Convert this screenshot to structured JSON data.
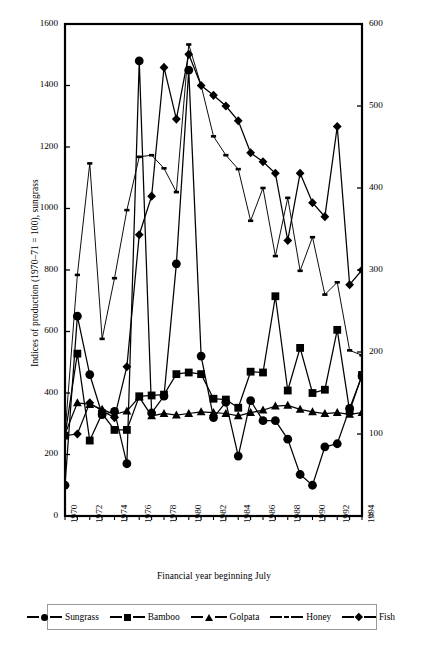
{
  "chart_data": {
    "type": "line",
    "title": "",
    "xlabel": "Financial year beginning July",
    "ylabel_left": "Indices of production (1970–71 = 100), sungrass",
    "ylabel_right": "Indices of production (1970–71 = 100), bamboo, golpata, honey and fish",
    "x": [
      1970,
      1971,
      1972,
      1973,
      1974,
      1975,
      1976,
      1977,
      1978,
      1979,
      1980,
      1981,
      1982,
      1983,
      1984,
      1985,
      1986,
      1987,
      1988,
      1989,
      1990,
      1991,
      1992,
      1993,
      1994
    ],
    "xticklabels": [
      "1970",
      "1972",
      "1974",
      "1976",
      "1978",
      "1980",
      "1982",
      "1984",
      "1986",
      "1988",
      "1990",
      "1992",
      "1994"
    ],
    "xtick_values": [
      1970,
      1972,
      1974,
      1976,
      1978,
      1980,
      1982,
      1984,
      1986,
      1988,
      1990,
      1992,
      1994
    ],
    "ylim_left": [
      0,
      1600
    ],
    "yticks_left": [
      0,
      200,
      400,
      600,
      800,
      1000,
      1200,
      1400,
      1600
    ],
    "ylim_right": [
      0,
      600
    ],
    "yticks_right": [
      0,
      100,
      200,
      300,
      400,
      500,
      600
    ],
    "grid": false,
    "legend_position": "below-plot",
    "series": [
      {
        "name": "Sungrass",
        "axis": "left",
        "marker": "circle",
        "values": [
          100,
          650,
          460,
          330,
          340,
          170,
          1480,
          335,
          390,
          820,
          1450,
          520,
          320,
          370,
          195,
          375,
          310,
          310,
          250,
          135,
          100,
          225,
          235,
          350,
          455
        ]
      },
      {
        "name": "Bamboo",
        "axis": "right",
        "marker": "square",
        "values": [
          98,
          198,
          92,
          125,
          105,
          105,
          146,
          147,
          148,
          173,
          175,
          173,
          143,
          142,
          132,
          176,
          175,
          268,
          153,
          205,
          150,
          154,
          227,
          128,
          172
        ]
      },
      {
        "name": "Golpata",
        "axis": "right",
        "marker": "triangle",
        "values": [
          100,
          138,
          136,
          130,
          124,
          128,
          145,
          122,
          125,
          123,
          125,
          127,
          126,
          125,
          122,
          126,
          129,
          134,
          135,
          130,
          127,
          125,
          126,
          124,
          126
        ]
      },
      {
        "name": "Honey",
        "axis": "right",
        "marker": "dash",
        "values": [
          100,
          294,
          430,
          216,
          290,
          373,
          438,
          440,
          424,
          395,
          575,
          525,
          463,
          440,
          423,
          360,
          400,
          317,
          388,
          299,
          340,
          270,
          285,
          202,
          196
        ]
      },
      {
        "name": "Fish",
        "axis": "right",
        "marker": "diamond",
        "values": [
          98,
          100,
          138,
          128,
          120,
          182,
          343,
          390,
          547,
          484,
          563,
          525,
          513,
          500,
          482,
          443,
          432,
          418,
          336,
          418,
          382,
          365,
          475,
          282,
          300
        ]
      }
    ]
  },
  "legend": {
    "items": [
      {
        "label": "Sungrass",
        "marker": "circle"
      },
      {
        "label": "Bamboo",
        "marker": "square"
      },
      {
        "label": "Golpata",
        "marker": "triangle"
      },
      {
        "label": "Honey",
        "marker": "dash"
      },
      {
        "label": "Fish",
        "marker": "diamond"
      }
    ]
  },
  "colors": {
    "line": "#000000",
    "axis": "#000000",
    "background": "#ffffff",
    "legend_border": "#9a9a9a"
  }
}
